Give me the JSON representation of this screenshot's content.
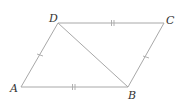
{
  "diagram": {
    "type": "geometry-figure",
    "shape": "parallelogram",
    "vertices": [
      {
        "label": "A",
        "x": 21,
        "y": 87
      },
      {
        "label": "B",
        "x": 128,
        "y": 87
      },
      {
        "label": "C",
        "x": 164,
        "y": 23
      },
      {
        "label": "D",
        "x": 58,
        "y": 23
      }
    ],
    "segments": [
      {
        "from": "A",
        "to": "B",
        "tick_marks": 2
      },
      {
        "from": "B",
        "to": "C",
        "tick_marks": 1
      },
      {
        "from": "C",
        "to": "D",
        "tick_marks": 2
      },
      {
        "from": "D",
        "to": "A",
        "tick_marks": 1
      },
      {
        "from": "D",
        "to": "B",
        "tick_marks": 0,
        "role": "diagonal"
      }
    ],
    "colors": {
      "line": "#a8a8a8",
      "label": "#333333",
      "background": "#ffffff"
    }
  }
}
